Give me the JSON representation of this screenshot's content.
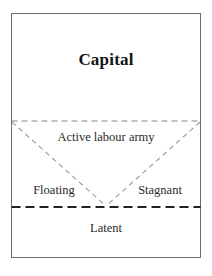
{
  "diagram": {
    "frame": {
      "border_color": "#6d6d6d",
      "background_color": "#ffffff"
    },
    "regions": [
      {
        "id": "capital",
        "label": "Capital",
        "emphasis": "bold"
      },
      {
        "id": "active-labour-army",
        "label": "Active labour army",
        "emphasis": "regular"
      },
      {
        "id": "floating",
        "label": "Floating",
        "emphasis": "regular"
      },
      {
        "id": "stagnant",
        "label": "Stagnant",
        "emphasis": "regular"
      },
      {
        "id": "latent",
        "label": "Latent",
        "emphasis": "regular"
      }
    ],
    "dividers": {
      "upper_dashed_label": "capital / labour boundary",
      "lower_dashed_label": "employed / latent boundary",
      "diagonal_left_label": "floating boundary",
      "diagonal_right_label": "stagnant boundary",
      "line_color": "#8a8a8a",
      "thick_line_color": "#222222"
    }
  }
}
